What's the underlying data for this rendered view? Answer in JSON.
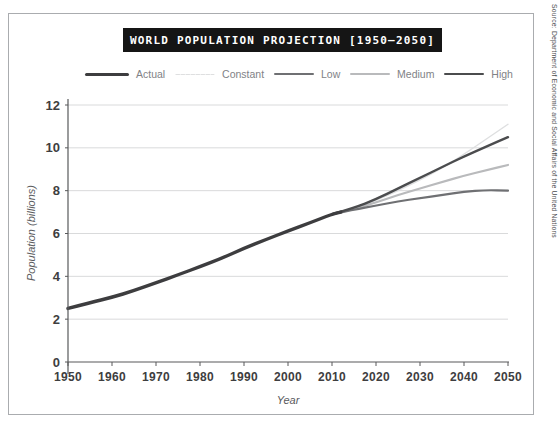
{
  "title": "WORLD POPULATION PROJECTION [1950–2050]",
  "source_note": "Source: Department of Economic and Social Affairs of the United Nations",
  "legend": {
    "items": [
      {
        "label": "Actual",
        "series": "Actual"
      },
      {
        "label": "Constant",
        "series": "Constant"
      },
      {
        "label": "Low",
        "series": "Low"
      },
      {
        "label": "Medium",
        "series": "Medium"
      },
      {
        "label": "High",
        "series": "High"
      }
    ]
  },
  "chart_data": {
    "type": "line",
    "xlabel": "Year",
    "ylabel": "Population (billions)",
    "xlim": [
      1950,
      2050
    ],
    "ylim": [
      0,
      12
    ],
    "xticks": [
      1950,
      1960,
      1970,
      1980,
      1990,
      2000,
      2010,
      2020,
      2030,
      2040,
      2050
    ],
    "yticks": [
      0,
      2,
      4,
      6,
      8,
      10,
      12
    ],
    "grid": "horizontal",
    "legend_position": "top",
    "colors": {
      "axis": "#58595b",
      "gridline": "#d9dadb",
      "tick_label": "#3e3e40",
      "title_bg": "#151515",
      "title_text": "#ffffff"
    },
    "series": [
      {
        "name": "Constant",
        "color": "#dedfe0",
        "width": 1.4,
        "dashed": true,
        "x": [
          2010,
          2015,
          2020,
          2025,
          2030,
          2035,
          2040,
          2045,
          2050
        ],
        "values": [
          6.9,
          7.18,
          7.55,
          8.0,
          8.5,
          9.05,
          9.7,
          10.4,
          11.1
        ]
      },
      {
        "name": "Medium",
        "color": "#b9babc",
        "width": 2.2,
        "dashed": false,
        "x": [
          2010,
          2015,
          2020,
          2025,
          2030,
          2035,
          2040,
          2045,
          2050
        ],
        "values": [
          6.9,
          7.15,
          7.45,
          7.8,
          8.1,
          8.4,
          8.7,
          8.95,
          9.2
        ]
      },
      {
        "name": "Low",
        "color": "#6f7073",
        "width": 2.2,
        "dashed": false,
        "x": [
          2010,
          2015,
          2020,
          2025,
          2030,
          2035,
          2040,
          2045,
          2050
        ],
        "values": [
          6.9,
          7.12,
          7.3,
          7.5,
          7.65,
          7.8,
          7.95,
          8.03,
          8.0
        ]
      },
      {
        "name": "High",
        "color": "#4b4c4e",
        "width": 2.4,
        "dashed": false,
        "x": [
          2010,
          2015,
          2020,
          2025,
          2030,
          2035,
          2040,
          2045,
          2050
        ],
        "values": [
          6.9,
          7.2,
          7.6,
          8.1,
          8.6,
          9.1,
          9.6,
          10.05,
          10.5
        ]
      },
      {
        "name": "Actual",
        "color": "#3d3d3f",
        "width": 3.4,
        "dashed": false,
        "x": [
          1950,
          1955,
          1960,
          1965,
          1970,
          1975,
          1980,
          1985,
          1990,
          1995,
          2000,
          2005,
          2010,
          2012
        ],
        "values": [
          2.5,
          2.77,
          3.02,
          3.33,
          3.7,
          4.07,
          4.45,
          4.85,
          5.31,
          5.72,
          6.12,
          6.5,
          6.9,
          7.0
        ]
      }
    ]
  }
}
